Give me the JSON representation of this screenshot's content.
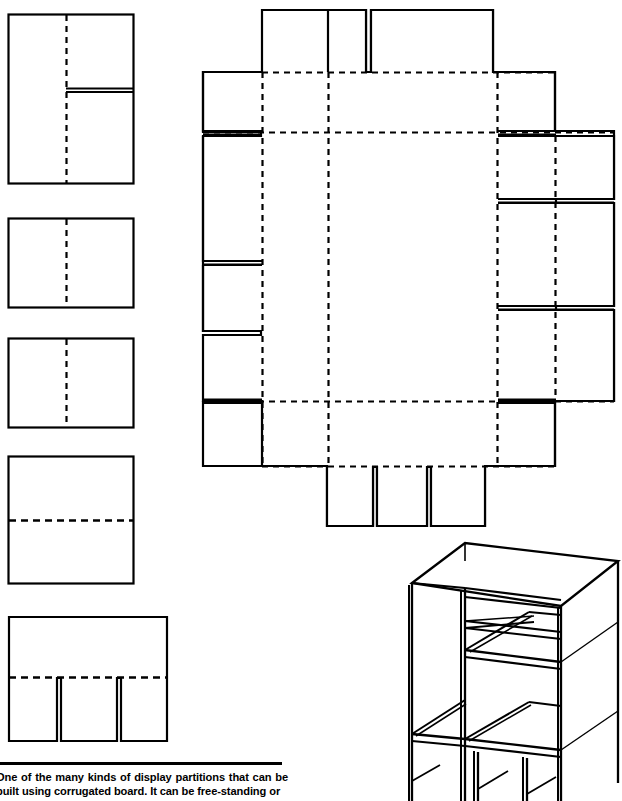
{
  "page": {
    "width": 622,
    "height": 801,
    "background": "#ffffff",
    "ink": "#000000"
  },
  "caption": {
    "rule_present": true,
    "text": "One of the many kinds of display partitions that can be built using corrugated board. It can be free-standing or"
  },
  "figure": {
    "line_color": "#000000",
    "cut_line_style": "solid",
    "fold_line_style": "dashed",
    "blanks": [
      {
        "id": "blank-1",
        "name": "partition-panel-slotted-upper",
        "x": 8,
        "y": 14,
        "width": 126,
        "height": 170,
        "fold_lines": [
          {
            "orientation": "vertical",
            "x": 66,
            "from_y": 14,
            "to_y": 184
          }
        ],
        "slots": [
          {
            "orientation": "horizontal",
            "x1": 66,
            "x2": 134,
            "y": 90,
            "width_px": 3
          }
        ]
      },
      {
        "id": "blank-2",
        "name": "partition-panel-plain-a",
        "x": 8,
        "y": 218,
        "width": 126,
        "height": 90,
        "fold_lines": [
          {
            "orientation": "vertical",
            "x": 66,
            "from_y": 218,
            "to_y": 308
          }
        ],
        "slots": []
      },
      {
        "id": "blank-3",
        "name": "partition-panel-plain-b",
        "x": 8,
        "y": 338,
        "width": 126,
        "height": 90,
        "fold_lines": [
          {
            "orientation": "vertical",
            "x": 66,
            "from_y": 338,
            "to_y": 428
          }
        ],
        "slots": []
      },
      {
        "id": "blank-4",
        "name": "partition-panel-horizontal-fold",
        "x": 8,
        "y": 456,
        "width": 126,
        "height": 128,
        "fold_lines": [
          {
            "orientation": "horizontal",
            "y": 520,
            "from_x": 8,
            "to_x": 134
          }
        ],
        "slots": []
      },
      {
        "id": "blank-5",
        "name": "partition-panel-three-tab",
        "x": 8,
        "y": 616,
        "width": 160,
        "height": 126,
        "fold_lines": [
          {
            "orientation": "horizontal",
            "y": 677,
            "from_x": 8,
            "to_x": 168
          }
        ],
        "tab_count": 3,
        "slots": [
          {
            "orientation": "vertical",
            "x": 58,
            "y1": 677,
            "y2": 742,
            "width_px": 4
          },
          {
            "orientation": "vertical",
            "x": 118,
            "y1": 677,
            "y2": 742,
            "width_px": 4
          }
        ]
      }
    ],
    "main_blank": {
      "id": "main-die-cut",
      "name": "display-partition-main-blank",
      "body": {
        "x": 262,
        "y": 72,
        "width": 236,
        "height": 330
      },
      "top_tabs": [
        {
          "name": "top-tab-left",
          "x": 328,
          "y": 10,
          "width": 38,
          "height": 62
        },
        {
          "name": "top-tab-right",
          "x": 371,
          "y": 10,
          "width": 122,
          "height": 62
        }
      ],
      "bottom_tabs": [
        {
          "name": "bottom-tab-left",
          "x": 327,
          "y": 466,
          "width": 46,
          "height": 60
        },
        {
          "name": "bottom-tab-center",
          "x": 377,
          "y": 466,
          "width": 50,
          "height": 60
        },
        {
          "name": "bottom-tab-right",
          "x": 431,
          "y": 466,
          "width": 54,
          "height": 60
        }
      ],
      "left_flaps": [
        {
          "name": "left-flap-upper",
          "x": 203,
          "y": 72,
          "width": 59,
          "height": 60
        },
        {
          "name": "left-flap-mid",
          "x": 203,
          "y": 136,
          "width": 59,
          "height": 125
        },
        {
          "name": "left-flap-lower",
          "x": 203,
          "y": 265,
          "width": 59,
          "height": 70
        },
        {
          "name": "left-flap-bottom",
          "x": 203,
          "y": 400,
          "width": 59,
          "height": 66
        }
      ],
      "right_flaps": [
        {
          "name": "right-flap-upper",
          "x": 498,
          "y": 72,
          "width": 57,
          "height": 60
        },
        {
          "name": "right-flap-outer",
          "x": 498,
          "y": 136,
          "width": 116,
          "height": 65
        },
        {
          "name": "right-flap-mid",
          "x": 498,
          "y": 205,
          "width": 116,
          "height": 100
        },
        {
          "name": "right-flap-lower",
          "x": 498,
          "y": 309,
          "width": 116,
          "height": 93
        },
        {
          "name": "right-flap-bottom",
          "x": 498,
          "y": 400,
          "width": 57,
          "height": 66
        }
      ],
      "fold_lines": {
        "vertical": [
          262,
          328,
          432,
          498
        ],
        "horizontal": [
          72,
          132,
          402,
          466
        ]
      }
    },
    "isometric": {
      "id": "assembled-unit",
      "name": "assembled-display-partition-isometric",
      "x": 400,
      "y": 540,
      "width": 222,
      "height": 261,
      "description": "Assembled free-standing display partition with open cubby compartments, drawn in isometric projection, cropped at the bottom edge of the page.",
      "compartment_rows": 3,
      "compartment_cols": 2
    }
  }
}
